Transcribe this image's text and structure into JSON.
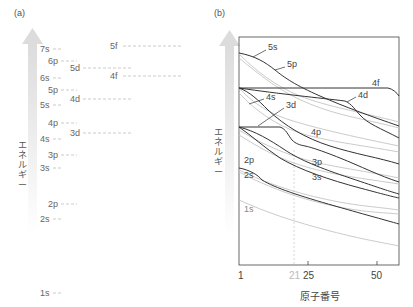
{
  "panel_a": {
    "label": "(a)",
    "y_axis_label": [
      "エ",
      "ネ",
      "ル",
      "ギ",
      "ー"
    ],
    "levels": [
      {
        "name": "7s",
        "x": 40,
        "y": 49,
        "line_len": 8
      },
      {
        "name": "6p",
        "x": 48,
        "y": 61,
        "line_len": 16
      },
      {
        "name": "5d",
        "x": 70,
        "y": 68,
        "line_len": 50
      },
      {
        "name": "6s",
        "x": 40,
        "y": 78,
        "line_len": 8
      },
      {
        "name": "5p",
        "x": 48,
        "y": 90,
        "line_len": 16
      },
      {
        "name": "5s",
        "x": 40,
        "y": 105,
        "line_len": 8
      },
      {
        "name": "4d",
        "x": 70,
        "y": 99,
        "line_len": 50
      },
      {
        "name": "4p",
        "x": 48,
        "y": 123,
        "line_len": 16
      },
      {
        "name": "3d",
        "x": 70,
        "y": 133,
        "line_len": 50
      },
      {
        "name": "4s",
        "x": 40,
        "y": 139,
        "line_len": 8
      },
      {
        "name": "3p",
        "x": 48,
        "y": 155,
        "line_len": 16
      },
      {
        "name": "3s",
        "x": 40,
        "y": 168,
        "line_len": 8
      },
      {
        "name": "2p",
        "x": 48,
        "y": 204,
        "line_len": 16
      },
      {
        "name": "2s",
        "x": 40,
        "y": 219,
        "line_len": 8
      },
      {
        "name": "1s",
        "x": 40,
        "y": 293,
        "line_len": 8
      },
      {
        "name": "5f",
        "x": 110,
        "y": 46,
        "line_len": 58
      },
      {
        "name": "4f",
        "x": 110,
        "y": 76,
        "line_len": 58
      }
    ]
  },
  "panel_b": {
    "label": "(b)",
    "y_axis_label": [
      "エ",
      "ネ",
      "ル",
      "ギ",
      "ー"
    ],
    "x_axis_label": "原子番号",
    "x_ticks": [
      {
        "label": "1",
        "x": 240,
        "dim": false
      },
      {
        "label": "21",
        "x": 294,
        "dim": true
      },
      {
        "label": "25",
        "x": 308,
        "dim": false
      },
      {
        "label": "50",
        "x": 376,
        "dim": false
      }
    ],
    "curve_labels": [
      {
        "name": "5s",
        "x": 268,
        "y": 47
      },
      {
        "name": "5p",
        "x": 287,
        "y": 64
      },
      {
        "name": "4f",
        "x": 372,
        "y": 83
      },
      {
        "name": "4d",
        "x": 358,
        "y": 95
      },
      {
        "name": "4s",
        "x": 266,
        "y": 97
      },
      {
        "name": "3d",
        "x": 286,
        "y": 105
      },
      {
        "name": "4p",
        "x": 311,
        "y": 132
      },
      {
        "name": "3p",
        "x": 312,
        "y": 162
      },
      {
        "name": "2p",
        "x": 244,
        "y": 160
      },
      {
        "name": "2s",
        "x": 244,
        "y": 175
      },
      {
        "name": "3s",
        "x": 312,
        "y": 177
      },
      {
        "name": "1s",
        "x": 244,
        "y": 209
      }
    ]
  },
  "colors": {
    "dark_curve": "#333333",
    "light_curve": "#bbbbbb",
    "arrow": "#e6e6e6",
    "dashed": "#aaaaaa"
  }
}
